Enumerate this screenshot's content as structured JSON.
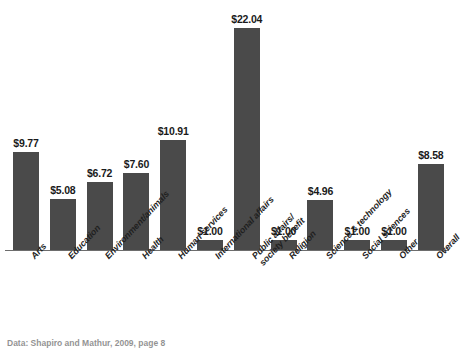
{
  "chart_data": {
    "type": "bar",
    "title": "",
    "xlabel": "",
    "ylabel": "",
    "ylim": [
      0,
      22.04
    ],
    "grid": false,
    "legend": "none",
    "value_prefix": "$",
    "categories": [
      "Arts",
      "Education",
      "Environment/animals",
      "Health",
      "Human services",
      "International affairs",
      "Public affairs/ society benefit",
      "Religion",
      "Science & technology",
      "Social sciences",
      "Other",
      "Overall"
    ],
    "values": [
      9.77,
      5.08,
      6.72,
      7.6,
      10.91,
      1.0,
      22.04,
      1.0,
      4.96,
      1.0,
      1.0,
      8.58
    ],
    "data_labels": [
      "$9.77",
      "$5.08",
      "$6.72",
      "$7.60",
      "$10.91",
      "$1.00",
      "$22.04",
      "$1.00",
      "$4.96",
      "$1.00",
      "$1.00",
      "$8.58"
    ],
    "bar_color": "#4a4a4a",
    "axis_color": "#6d6d6d",
    "background": "#ffffff"
  },
  "labels": [
    {
      "line1": "Arts",
      "line2": ""
    },
    {
      "line1": "Education",
      "line2": ""
    },
    {
      "line1": "Environment/animals",
      "line2": ""
    },
    {
      "line1": "Health",
      "line2": ""
    },
    {
      "line1": "Human services",
      "line2": ""
    },
    {
      "line1": "International affairs",
      "line2": ""
    },
    {
      "line1": "Public affairs/",
      "line2": "society benefit"
    },
    {
      "line1": "Religion",
      "line2": ""
    },
    {
      "line1": "Science & technology",
      "line2": ""
    },
    {
      "line1": "Social sciences",
      "line2": ""
    },
    {
      "line1": "Other",
      "line2": ""
    },
    {
      "line1": "Overall",
      "line2": ""
    }
  ],
  "footer": {
    "source_note": "Data: Shapiro and Mathur, 2009, page 8"
  }
}
